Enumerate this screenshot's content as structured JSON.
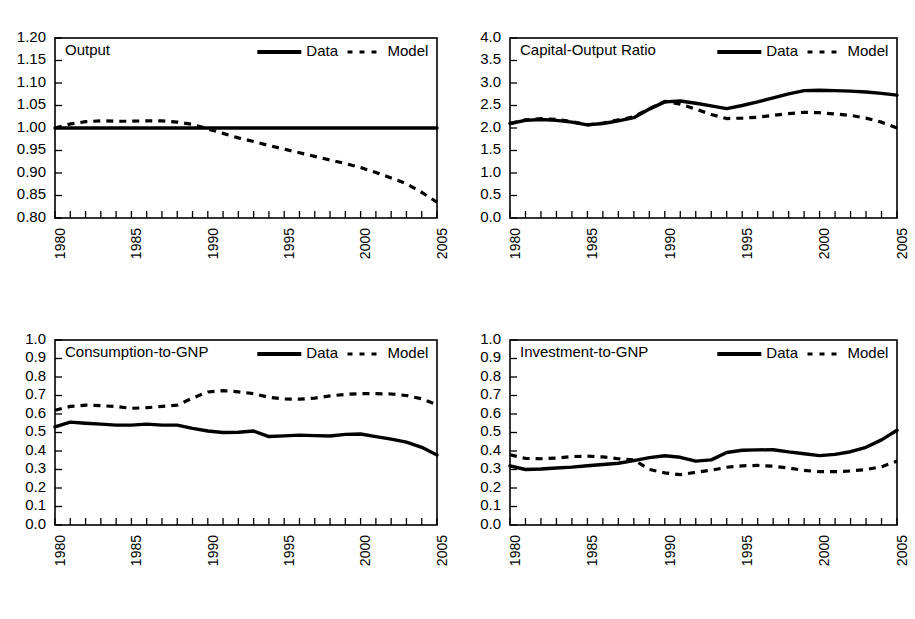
{
  "figure": {
    "panel_count": 4,
    "legend": {
      "data_label": "Data",
      "model_label": "Model"
    },
    "line_color": "#000000",
    "background": "#ffffff"
  },
  "chart_data": [
    {
      "type": "line",
      "title": "Output",
      "xlabel": "",
      "ylabel": "",
      "xlim": [
        1980,
        2005
      ],
      "ylim": [
        0.8,
        1.2
      ],
      "yticks": [
        "0.80",
        "0.85",
        "0.90",
        "0.95",
        "1.00",
        "1.05",
        "1.10",
        "1.15",
        "1.20"
      ],
      "xticks": [
        "1980",
        "1985",
        "1990",
        "1995",
        "2000",
        "2005"
      ],
      "grid": false,
      "legend_position": "top-right",
      "x": [
        1980,
        1981,
        1982,
        1983,
        1984,
        1985,
        1986,
        1987,
        1988,
        1989,
        1990,
        1991,
        1992,
        1993,
        1994,
        1995,
        1996,
        1997,
        1998,
        1999,
        2000,
        2001,
        2002,
        2003,
        2004,
        2005
      ],
      "series": [
        {
          "name": "Data",
          "style": "solid",
          "values": [
            1.0,
            1.0,
            1.0,
            1.0,
            1.0,
            1.0,
            1.0,
            1.0,
            1.0,
            1.0,
            1.0,
            1.0,
            1.0,
            1.0,
            1.0,
            1.0,
            1.0,
            1.0,
            1.0,
            1.0,
            1.0,
            1.0,
            1.0,
            1.0,
            1.0,
            1.0
          ]
        },
        {
          "name": "Model",
          "style": "dashed",
          "values": [
            1.0,
            1.009,
            1.014,
            1.016,
            1.015,
            1.015,
            1.016,
            1.016,
            1.013,
            1.008,
            0.998,
            0.988,
            0.978,
            0.97,
            0.961,
            0.953,
            0.945,
            0.937,
            0.929,
            0.921,
            0.912,
            0.901,
            0.889,
            0.876,
            0.857,
            0.835
          ]
        }
      ]
    },
    {
      "type": "line",
      "title": "Capital-Output Ratio",
      "xlabel": "",
      "ylabel": "",
      "xlim": [
        1980,
        2005
      ],
      "ylim": [
        0.0,
        4.0
      ],
      "yticks": [
        "0.0",
        "0.5",
        "1.0",
        "1.5",
        "2.0",
        "2.5",
        "3.0",
        "3.5",
        "4.0"
      ],
      "xticks": [
        "1980",
        "1985",
        "1990",
        "1995",
        "2000",
        "2005"
      ],
      "grid": false,
      "legend_position": "top-right",
      "x": [
        1980,
        1981,
        1982,
        1983,
        1984,
        1985,
        1986,
        1987,
        1988,
        1989,
        1990,
        1991,
        1992,
        1993,
        1994,
        1995,
        1996,
        1997,
        1998,
        1999,
        2000,
        2001,
        2002,
        2003,
        2004,
        2005
      ],
      "series": [
        {
          "name": "Data",
          "style": "solid",
          "values": [
            2.1,
            2.17,
            2.19,
            2.17,
            2.13,
            2.07,
            2.1,
            2.16,
            2.23,
            2.42,
            2.58,
            2.6,
            2.55,
            2.49,
            2.43,
            2.5,
            2.58,
            2.67,
            2.76,
            2.83,
            2.84,
            2.83,
            2.82,
            2.8,
            2.77,
            2.73
          ]
        },
        {
          "name": "Model",
          "style": "dashed",
          "values": [
            2.1,
            2.18,
            2.21,
            2.19,
            2.14,
            2.07,
            2.11,
            2.18,
            2.25,
            2.43,
            2.59,
            2.53,
            2.42,
            2.3,
            2.21,
            2.22,
            2.24,
            2.28,
            2.32,
            2.35,
            2.34,
            2.31,
            2.28,
            2.22,
            2.13,
            2.0
          ]
        }
      ]
    },
    {
      "type": "line",
      "title": "Consumption-to-GNP",
      "xlabel": "",
      "ylabel": "",
      "xlim": [
        1980,
        2005
      ],
      "ylim": [
        0.0,
        1.0
      ],
      "yticks": [
        "0.0",
        "0.1",
        "0.2",
        "0.3",
        "0.4",
        "0.5",
        "0.6",
        "0.7",
        "0.8",
        "0.9",
        "1.0"
      ],
      "xticks": [
        "1980",
        "1985",
        "1990",
        "1995",
        "2000",
        "2005"
      ],
      "grid": false,
      "legend_position": "top-right",
      "x": [
        1980,
        1981,
        1982,
        1983,
        1984,
        1985,
        1986,
        1987,
        1988,
        1989,
        1990,
        1991,
        1992,
        1993,
        1994,
        1995,
        1996,
        1997,
        1998,
        1999,
        2000,
        2001,
        2002,
        2003,
        2004,
        2005
      ],
      "series": [
        {
          "name": "Data",
          "style": "solid",
          "values": [
            0.53,
            0.556,
            0.55,
            0.545,
            0.54,
            0.54,
            0.545,
            0.54,
            0.54,
            0.522,
            0.508,
            0.5,
            0.501,
            0.508,
            0.478,
            0.482,
            0.486,
            0.483,
            0.481,
            0.49,
            0.492,
            0.478,
            0.464,
            0.448,
            0.42,
            0.378
          ]
        },
        {
          "name": "Model",
          "style": "dashed",
          "values": [
            0.62,
            0.641,
            0.648,
            0.645,
            0.64,
            0.631,
            0.634,
            0.641,
            0.648,
            0.686,
            0.719,
            0.726,
            0.72,
            0.71,
            0.69,
            0.681,
            0.68,
            0.686,
            0.698,
            0.706,
            0.71,
            0.71,
            0.708,
            0.7,
            0.682,
            0.65
          ]
        }
      ]
    },
    {
      "type": "line",
      "title": "Investment-to-GNP",
      "xlabel": "",
      "ylabel": "",
      "xlim": [
        1980,
        2005
      ],
      "ylim": [
        0.0,
        1.0
      ],
      "yticks": [
        "0.0",
        "0.1",
        "0.2",
        "0.3",
        "0.4",
        "0.5",
        "0.6",
        "0.7",
        "0.8",
        "0.9",
        "1.0"
      ],
      "xticks": [
        "1980",
        "1985",
        "1990",
        "1995",
        "2000",
        "2005"
      ],
      "grid": false,
      "legend_position": "top-right",
      "x": [
        1980,
        1981,
        1982,
        1983,
        1984,
        1985,
        1986,
        1987,
        1988,
        1989,
        1990,
        1991,
        1992,
        1993,
        1994,
        1995,
        1996,
        1997,
        1998,
        1999,
        2000,
        2001,
        2002,
        2003,
        2004,
        2005
      ],
      "series": [
        {
          "name": "Data",
          "style": "solid",
          "values": [
            0.32,
            0.3,
            0.303,
            0.308,
            0.313,
            0.32,
            0.327,
            0.334,
            0.348,
            0.364,
            0.374,
            0.366,
            0.345,
            0.352,
            0.392,
            0.404,
            0.406,
            0.407,
            0.395,
            0.385,
            0.375,
            0.382,
            0.396,
            0.42,
            0.46,
            0.512
          ]
        },
        {
          "name": "Model",
          "style": "dashed",
          "values": [
            0.38,
            0.36,
            0.358,
            0.362,
            0.37,
            0.372,
            0.368,
            0.358,
            0.352,
            0.3,
            0.282,
            0.272,
            0.285,
            0.296,
            0.312,
            0.32,
            0.322,
            0.318,
            0.308,
            0.295,
            0.288,
            0.288,
            0.292,
            0.3,
            0.315,
            0.345
          ]
        }
      ]
    }
  ]
}
